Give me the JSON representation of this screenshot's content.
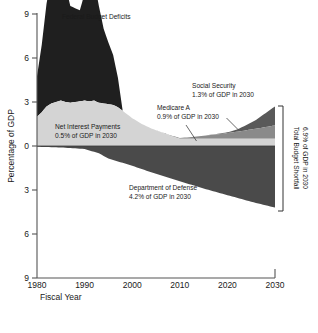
{
  "chart_data": {
    "type": "area",
    "title": "Federal Budget Deficits",
    "xlabel": "Fiscal Year",
    "ylabel": "Percentage of GDP",
    "xlim": [
      1980,
      2030
    ],
    "ylim": [
      -9,
      9
    ],
    "grid": false,
    "legend_position": "inline-annotations",
    "x_ticks": [
      "1980",
      "1990",
      "2000",
      "2010",
      "2020",
      "2030"
    ],
    "x_tick_values": [
      1980,
      1990,
      2000,
      2010,
      2020,
      2030
    ],
    "y_ticks": [
      "9",
      "6",
      "3",
      "0",
      "3",
      "6",
      "9"
    ],
    "y_tick_values": [
      9,
      6,
      3,
      0,
      -3,
      -6,
      -9
    ],
    "note": "Values above zero are spending/deficit categories stacked upward; Department of Defense is drawn downward below zero.",
    "series": [
      {
        "name": "Federal Budget Deficits",
        "color": "#1f1f1f",
        "direction": "up",
        "stack_order": 4,
        "x": [
          1980,
          1981,
          1982,
          1983,
          1984,
          1985,
          1986,
          1987,
          1988,
          1989,
          1990,
          1991,
          1992,
          1993,
          1994,
          1995,
          1996,
          1997,
          1998,
          1999,
          2000,
          2005,
          2010,
          2015,
          2020,
          2025,
          2030
        ],
        "values": [
          2.75,
          4.6,
          7.0,
          8.6,
          7.6,
          8.4,
          7.9,
          6.6,
          6.4,
          6.2,
          7.3,
          8.3,
          8.2,
          6.6,
          5.1,
          4.2,
          3.4,
          2.0,
          0.0,
          0.0,
          0.0,
          0.0,
          0.0,
          0.0,
          0.0,
          0.0,
          0.0
        ]
      },
      {
        "name": "Social Security",
        "color": "#595959",
        "direction": "up",
        "stack_order": 3,
        "x": [
          1980,
          1990,
          2000,
          2005,
          2010,
          2015,
          2020,
          2022,
          2024,
          2026,
          2028,
          2030
        ],
        "values": [
          0.0,
          0.0,
          0.0,
          0.0,
          0.0,
          0.0,
          0.05,
          0.15,
          0.35,
          0.6,
          0.95,
          1.3
        ]
      },
      {
        "name": "Medicare A",
        "color": "#8a8a8a",
        "direction": "up",
        "stack_order": 2,
        "x": [
          1980,
          1990,
          2000,
          2005,
          2010,
          2012,
          2015,
          2018,
          2020,
          2023,
          2026,
          2030
        ],
        "values": [
          0.0,
          0.0,
          0.0,
          0.0,
          0.05,
          0.1,
          0.2,
          0.3,
          0.38,
          0.52,
          0.68,
          0.9
        ]
      },
      {
        "name": "Net Interest Payments",
        "color": "#d4d4d4",
        "direction": "up",
        "stack_order": 1,
        "x": [
          1980,
          1981,
          1982,
          1983,
          1984,
          1985,
          1986,
          1987,
          1988,
          1989,
          1990,
          1991,
          1992,
          1993,
          1994,
          1995,
          1996,
          1997,
          1998,
          1999,
          2000,
          2002,
          2004,
          2006,
          2008,
          2010,
          2015,
          2020,
          2025,
          2030
        ],
        "values": [
          2.0,
          2.3,
          2.7,
          2.9,
          3.0,
          3.1,
          3.0,
          2.95,
          3.0,
          3.05,
          3.1,
          3.05,
          3.1,
          2.95,
          2.9,
          2.85,
          2.8,
          2.65,
          2.4,
          2.15,
          1.9,
          1.5,
          1.2,
          0.95,
          0.7,
          0.5,
          0.5,
          0.5,
          0.5,
          0.5
        ]
      },
      {
        "name": "Department of Defense",
        "color": "#4a4a4a",
        "direction": "down",
        "stack_order": 0,
        "x": [
          1980,
          1985,
          1990,
          1993,
          1995,
          2000,
          2005,
          2010,
          2015,
          2020,
          2025,
          2030
        ],
        "values": [
          0.05,
          0.1,
          0.2,
          0.5,
          0.85,
          1.35,
          1.9,
          2.4,
          2.9,
          3.35,
          3.8,
          4.2
        ]
      }
    ],
    "annotations": [
      {
        "name": "federal-budget-deficits",
        "lines": [
          "Federal Budget Deficits"
        ],
        "x": 1990,
        "y": 9.0
      },
      {
        "name": "net-interest-payments",
        "lines": [
          "Net Interest Payments",
          "0.5% of GDP in 2030"
        ],
        "x": 1987,
        "y": 1.6
      },
      {
        "name": "medicare-a",
        "lines": [
          "Medicare A",
          "0.9% of GDP in 2030"
        ],
        "x": 2009,
        "y": 2.3
      },
      {
        "name": "social-security",
        "lines": [
          "Social Security",
          "1.3% of GDP in 2030"
        ],
        "x": 2018,
        "y": 3.5
      },
      {
        "name": "department-of-defense",
        "lines": [
          "Department of Defense",
          "4.2% of GDP in 2030"
        ],
        "x": 2004,
        "y": -2.6
      },
      {
        "name": "total-budget-shortfall",
        "lines": [
          "Total Budget Shortfall",
          "6.9% of GDP in 2030"
        ],
        "x": 2030,
        "y": 0,
        "rotated": true
      }
    ]
  },
  "axes": {
    "y_label": "Percentage of GDP",
    "x_label": "Fiscal Year",
    "y_tick_0": "9",
    "y_tick_1": "6",
    "y_tick_2": "3",
    "y_tick_3": "0",
    "y_tick_4": "3",
    "y_tick_5": "6",
    "y_tick_6": "9",
    "x_tick_0": "1980",
    "x_tick_1": "1990",
    "x_tick_2": "2000",
    "x_tick_3": "2010",
    "x_tick_4": "2020",
    "x_tick_5": "2030"
  },
  "labels": {
    "deficits_title": "Federal Budget Deficits",
    "net_interest_l1": "Net Interest Payments",
    "net_interest_l2": "0.5% of GDP in 2030",
    "medicare_l1": "Medicare A",
    "medicare_l2": "0.9% of GDP in 2030",
    "social_security_l1": "Social Security",
    "social_security_l2": "1.3% of GDP in 2030",
    "defense_l1": "Department of Defense",
    "defense_l2": "4.2% of GDP in 2030",
    "shortfall_l1": "Total Budget Shortfall",
    "shortfall_l2": "6.9% of GDP in 2030"
  },
  "colors": {
    "deficits": "#1f1f1f",
    "social_security": "#595959",
    "medicare": "#8a8a8a",
    "net_interest": "#d4d4d4",
    "defense": "#4a4a4a",
    "axis": "#555555",
    "background": "#ffffff"
  }
}
